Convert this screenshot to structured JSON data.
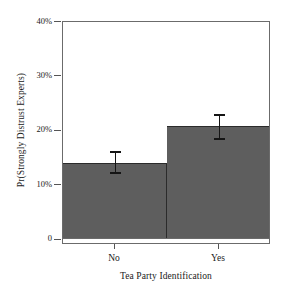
{
  "chart_data": {
    "type": "bar",
    "title": "",
    "xlabel": "Tea Party Identification",
    "ylabel": "Pr(Strongly Distrust Experts)",
    "categories": [
      "No",
      "Yes"
    ],
    "values": [
      13.8,
      20.7
    ],
    "error_low": [
      11.8,
      18.2
    ],
    "error_high": [
      16.1,
      22.9
    ],
    "ylim": [
      0,
      40
    ],
    "yticks": [
      0,
      10,
      20,
      30,
      40
    ],
    "ytick_labels": [
      "0",
      "10%",
      "20%",
      "30%",
      "40%"
    ],
    "grid": false,
    "legend": "none",
    "bar_color": "#5e5e5e",
    "error_color": "#151515",
    "frame_color": "#6b6b6b"
  },
  "axes": {
    "y_title": "Pr(Strongly Distrust Experts)",
    "x_title": "Tea Party Identification",
    "y_labels": {
      "t0": "0",
      "t10": "10%",
      "t20": "20%",
      "t30": "30%",
      "t40": "40%"
    },
    "x_labels": {
      "no": "No",
      "yes": "Yes"
    }
  }
}
